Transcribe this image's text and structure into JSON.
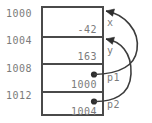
{
  "diagram": {
    "colors": {
      "border": "#4a4a4a",
      "text": "#7b7b7b",
      "arrow": "#3c3c3c",
      "background": "#ffffff"
    },
    "addresses": [
      {
        "label": "1000"
      },
      {
        "label": "1004"
      },
      {
        "label": "1008"
      },
      {
        "label": "1012"
      }
    ],
    "cells": [
      {
        "address": "1000",
        "value": "-42",
        "variable": "x"
      },
      {
        "address": "1004",
        "value": "163",
        "variable": "y"
      },
      {
        "address": "1008",
        "value": "1000",
        "variable": "p1"
      },
      {
        "address": "1012",
        "value": "1004",
        "variable": "p2"
      }
    ],
    "pointers": [
      {
        "from": "p1",
        "from_address": "1008",
        "to_address": "1000",
        "to_variable": "x"
      },
      {
        "from": "p2",
        "from_address": "1012",
        "to_address": "1004",
        "to_variable": "y"
      }
    ]
  }
}
